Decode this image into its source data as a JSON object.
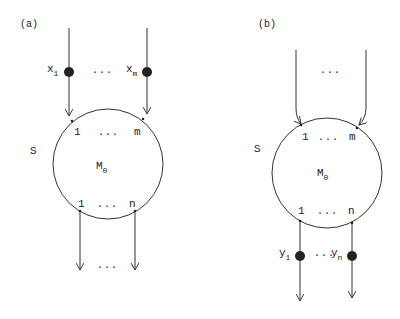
{
  "diagram": {
    "colors": {
      "stroke": "#333333",
      "dot": "#222222",
      "background": "#ffffff"
    },
    "panel_a": {
      "label": "(a)",
      "system_label": "S",
      "module": {
        "name": "M",
        "subscript": "0"
      },
      "inputs": {
        "first_port": "1",
        "last_port": "m",
        "ellipsis": "..."
      },
      "outputs": {
        "first_port": "1",
        "last_port": "n",
        "ellipsis": "..."
      },
      "input_vars": {
        "first": {
          "name": "x",
          "subscript": "1"
        },
        "last": {
          "name": "x",
          "subscript": "m"
        },
        "ellipsis": "..."
      },
      "output_ellipsis": "..."
    },
    "panel_b": {
      "label": "(b)",
      "system_label": "S",
      "module": {
        "name": "M",
        "subscript": "0"
      },
      "inputs": {
        "first_port": "1",
        "last_port": "m",
        "ellipsis": "..."
      },
      "outputs": {
        "first_port": "1",
        "last_port": "n",
        "ellipsis": "..."
      },
      "output_vars": {
        "first": {
          "name": "y",
          "subscript": "1"
        },
        "last": {
          "name": "y",
          "subscript": "n"
        },
        "ellipsis": "..."
      },
      "input_ellipsis": "..."
    }
  }
}
